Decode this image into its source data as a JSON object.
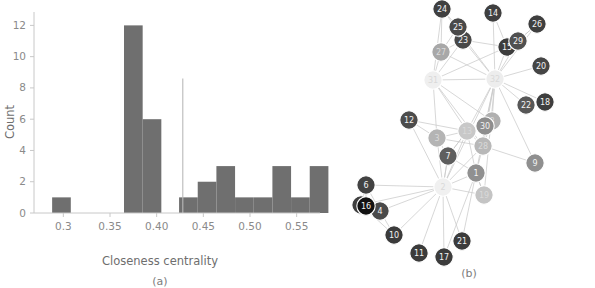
{
  "figure": {
    "panel_a_caption": "(a)",
    "panel_b_caption": "(b)"
  },
  "chart_data": [
    {
      "type": "bar",
      "title": "",
      "subtitle": "",
      "xlabel": "Closeness centrality",
      "ylabel": "Count",
      "xlim": [
        0.275,
        0.575
      ],
      "ylim": [
        0,
        12.6
      ],
      "grid": false,
      "legend": null,
      "xticks": [
        0.3,
        0.35,
        0.4,
        0.45,
        0.5,
        0.55
      ],
      "xtick_labels": [
        "0.3",
        "0.35",
        "0.40",
        "0.45",
        "0.50",
        "0.55"
      ],
      "yticks": [
        0,
        2,
        4,
        6,
        8,
        10,
        12
      ],
      "ytick_labels": [
        "0",
        "2",
        "4",
        "6",
        "8",
        "10",
        "12"
      ],
      "bin_width": 0.02,
      "bins": [
        {
          "left": 0.288,
          "right": 0.308,
          "count": 1
        },
        {
          "left": 0.365,
          "right": 0.385,
          "count": 12
        },
        {
          "left": 0.385,
          "right": 0.405,
          "count": 6
        },
        {
          "left": 0.424,
          "right": 0.444,
          "count": 1
        },
        {
          "left": 0.444,
          "right": 0.464,
          "count": 2
        },
        {
          "left": 0.464,
          "right": 0.484,
          "count": 3
        },
        {
          "left": 0.484,
          "right": 0.504,
          "count": 1
        },
        {
          "left": 0.504,
          "right": 0.524,
          "count": 1
        },
        {
          "left": 0.524,
          "right": 0.544,
          "count": 3
        },
        {
          "left": 0.544,
          "right": 0.564,
          "count": 1
        },
        {
          "left": 0.564,
          "right": 0.584,
          "count": 3
        }
      ],
      "annotations": [
        {
          "kind": "vertical-line",
          "x": 0.428,
          "y_top": 8.6,
          "y_bottom": 0
        }
      ],
      "bar_color": "#6f6f6f",
      "axis_color": "#c8c8c8",
      "text_color": "#8a8a8a"
    },
    {
      "type": "network",
      "title": "",
      "node_count": 32,
      "colormap": "grayscale-by-closeness-centrality",
      "nodes": [
        {
          "id": "1",
          "x": 146,
          "y": 173,
          "c": "#909090"
        },
        {
          "id": "2",
          "x": 113,
          "y": 187,
          "c": "#f0f0f0"
        },
        {
          "id": "3",
          "x": 107,
          "y": 138,
          "c": "#b4b4b4"
        },
        {
          "id": "4",
          "x": 50,
          "y": 211,
          "c": "#4a4a4a"
        },
        {
          "id": "5",
          "x": 31,
          "y": 205,
          "c": "#3f3f3f"
        },
        {
          "id": "6",
          "x": 36,
          "y": 185,
          "c": "#424242"
        },
        {
          "id": "7",
          "x": 118,
          "y": 156,
          "c": "#5e5e5e"
        },
        {
          "id": "8",
          "x": 162,
          "y": 121,
          "c": "#b0b0b0"
        },
        {
          "id": "9",
          "x": 205,
          "y": 163,
          "c": "#8f8f8f"
        },
        {
          "id": "10",
          "x": 64,
          "y": 235,
          "c": "#3b3b3b"
        },
        {
          "id": "11",
          "x": 89,
          "y": 253,
          "c": "#3b3b3b"
        },
        {
          "id": "12",
          "x": 79,
          "y": 120,
          "c": "#4c4c4c"
        },
        {
          "id": "13",
          "x": 137,
          "y": 131,
          "c": "#c8c8c8"
        },
        {
          "id": "14",
          "x": 163,
          "y": 13,
          "c": "#3f3f3f"
        },
        {
          "id": "15",
          "x": 177,
          "y": 47,
          "c": "#3d3d3d"
        },
        {
          "id": "16",
          "x": 36,
          "y": 206,
          "c": "#121212"
        },
        {
          "id": "17",
          "x": 114,
          "y": 257,
          "c": "#3c3c3c"
        },
        {
          "id": "18",
          "x": 215,
          "y": 102,
          "c": "#3e3e3e"
        },
        {
          "id": "19",
          "x": 154,
          "y": 195,
          "c": "#c4c4c4"
        },
        {
          "id": "20",
          "x": 211,
          "y": 66,
          "c": "#454545"
        },
        {
          "id": "21",
          "x": 132,
          "y": 241,
          "c": "#3c3c3c"
        },
        {
          "id": "22",
          "x": 196,
          "y": 105,
          "c": "#575757"
        },
        {
          "id": "23",
          "x": 133,
          "y": 40,
          "c": "#484848"
        },
        {
          "id": "24",
          "x": 112,
          "y": 9,
          "c": "#404040"
        },
        {
          "id": "25",
          "x": 128,
          "y": 27,
          "c": "#494949"
        },
        {
          "id": "26",
          "x": 207,
          "y": 24,
          "c": "#3f3f3f"
        },
        {
          "id": "27",
          "x": 111,
          "y": 52,
          "c": "#a8a8a8"
        },
        {
          "id": "28",
          "x": 153,
          "y": 146,
          "c": "#b8b8b8"
        },
        {
          "id": "29",
          "x": 188,
          "y": 41,
          "c": "#505050"
        },
        {
          "id": "30",
          "x": 155,
          "y": 126,
          "c": "#8e8e8e"
        },
        {
          "id": "31",
          "x": 103,
          "y": 80,
          "c": "#efefef"
        },
        {
          "id": "32",
          "x": 165,
          "y": 79,
          "c": "#ededed"
        }
      ],
      "edges": [
        [
          "24",
          "27"
        ],
        [
          "24",
          "25"
        ],
        [
          "24",
          "31"
        ],
        [
          "24",
          "32"
        ],
        [
          "25",
          "27"
        ],
        [
          "25",
          "23"
        ],
        [
          "27",
          "31"
        ],
        [
          "27",
          "32"
        ],
        [
          "27",
          "23"
        ],
        [
          "23",
          "32"
        ],
        [
          "23",
          "31"
        ],
        [
          "23",
          "15"
        ],
        [
          "14",
          "32"
        ],
        [
          "14",
          "15"
        ],
        [
          "15",
          "32"
        ],
        [
          "15",
          "29"
        ],
        [
          "15",
          "31"
        ],
        [
          "29",
          "32"
        ],
        [
          "29",
          "26"
        ],
        [
          "29",
          "15"
        ],
        [
          "26",
          "29"
        ],
        [
          "26",
          "32"
        ],
        [
          "20",
          "32"
        ],
        [
          "18",
          "32"
        ],
        [
          "22",
          "32"
        ],
        [
          "31",
          "32"
        ],
        [
          "31",
          "13"
        ],
        [
          "31",
          "8"
        ],
        [
          "31",
          "3"
        ],
        [
          "31",
          "28"
        ],
        [
          "32",
          "8"
        ],
        [
          "32",
          "30"
        ],
        [
          "32",
          "28"
        ],
        [
          "32",
          "13"
        ],
        [
          "32",
          "9"
        ],
        [
          "32",
          "19"
        ],
        [
          "32",
          "1"
        ],
        [
          "32",
          "2"
        ],
        [
          "12",
          "3"
        ],
        [
          "12",
          "2"
        ],
        [
          "12",
          "13"
        ],
        [
          "3",
          "13"
        ],
        [
          "3",
          "7"
        ],
        [
          "3",
          "2"
        ],
        [
          "3",
          "28"
        ],
        [
          "13",
          "7"
        ],
        [
          "13",
          "1"
        ],
        [
          "13",
          "2"
        ],
        [
          "13",
          "28"
        ],
        [
          "13",
          "8"
        ],
        [
          "8",
          "28"
        ],
        [
          "8",
          "30"
        ],
        [
          "8",
          "13"
        ],
        [
          "30",
          "28"
        ],
        [
          "28",
          "1"
        ],
        [
          "28",
          "9"
        ],
        [
          "28",
          "2"
        ],
        [
          "7",
          "1"
        ],
        [
          "7",
          "2"
        ],
        [
          "7",
          "13"
        ],
        [
          "1",
          "2"
        ],
        [
          "1",
          "19"
        ],
        [
          "1",
          "17"
        ],
        [
          "1",
          "21"
        ],
        [
          "19",
          "1"
        ],
        [
          "19",
          "2"
        ],
        [
          "2",
          "6"
        ],
        [
          "2",
          "5"
        ],
        [
          "2",
          "4"
        ],
        [
          "2",
          "10"
        ],
        [
          "2",
          "11"
        ],
        [
          "2",
          "17"
        ],
        [
          "2",
          "21"
        ],
        [
          "2",
          "7"
        ],
        [
          "16",
          "5"
        ],
        [
          "16",
          "6"
        ],
        [
          "6",
          "5"
        ],
        [
          "6",
          "4"
        ],
        [
          "5",
          "10"
        ],
        [
          "5",
          "4"
        ],
        [
          "4",
          "10"
        ]
      ],
      "edge_color": "#c9c9c9",
      "node_stroke": "#ffffff"
    }
  ]
}
